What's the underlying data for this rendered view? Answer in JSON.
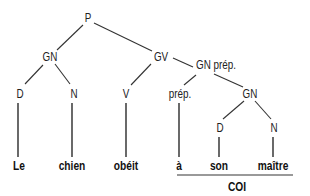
{
  "diagram": {
    "type": "syntax-tree",
    "language": "fr",
    "nodes": {
      "p": "P",
      "gn_subject": "GN",
      "gv": "GV",
      "gn_prep": "GN prép.",
      "d_subject": "D",
      "n_subject": "N",
      "v": "V",
      "prep": "prép.",
      "gn_object": "GN",
      "d_object": "D",
      "n_object": "N"
    },
    "words": {
      "w1": "Le",
      "w2": "chien",
      "w3": "obéit",
      "w4": "à",
      "w5": "son",
      "w6": "maître"
    },
    "annotation": {
      "underline_label": "COI"
    },
    "edges": [
      [
        "P",
        "GN"
      ],
      [
        "P",
        "GV"
      ],
      [
        "GN",
        "D"
      ],
      [
        "GN",
        "N"
      ],
      [
        "GV",
        "V"
      ],
      [
        "GV",
        "GN prép."
      ],
      [
        "GN prép.",
        "prép."
      ],
      [
        "GN prép.",
        "GN"
      ],
      [
        "GN",
        "D"
      ],
      [
        "GN",
        "N"
      ],
      [
        "D",
        "Le"
      ],
      [
        "N",
        "chien"
      ],
      [
        "V",
        "obéit"
      ],
      [
        "prép.",
        "à"
      ],
      [
        "D",
        "son"
      ],
      [
        "N",
        "maître"
      ]
    ]
  }
}
